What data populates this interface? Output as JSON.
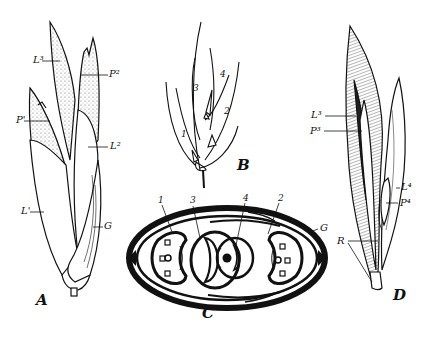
{
  "figure": {
    "panels": {
      "A": {
        "letter": "A",
        "labels": {
          "L3": "L³",
          "P2": "P²",
          "P1": "P'",
          "L2": "L²",
          "L1": "L'",
          "G": "G"
        }
      },
      "B": {
        "letter": "B",
        "labels": {
          "n1": "1",
          "n2": "2",
          "n3": "3",
          "n4": "4"
        }
      },
      "C": {
        "letter": "C",
        "labels": {
          "n1": "1",
          "n3": "3",
          "n4": "4",
          "n2": "2",
          "G": "G"
        }
      },
      "D": {
        "letter": "D",
        "labels": {
          "L3": "L³",
          "P3": "P³",
          "L4": "L⁴",
          "P4": "P⁴",
          "R": "R"
        }
      }
    },
    "colors": {
      "ink": "#111111",
      "paper": "#ffffff",
      "stipple": "#777777"
    }
  }
}
